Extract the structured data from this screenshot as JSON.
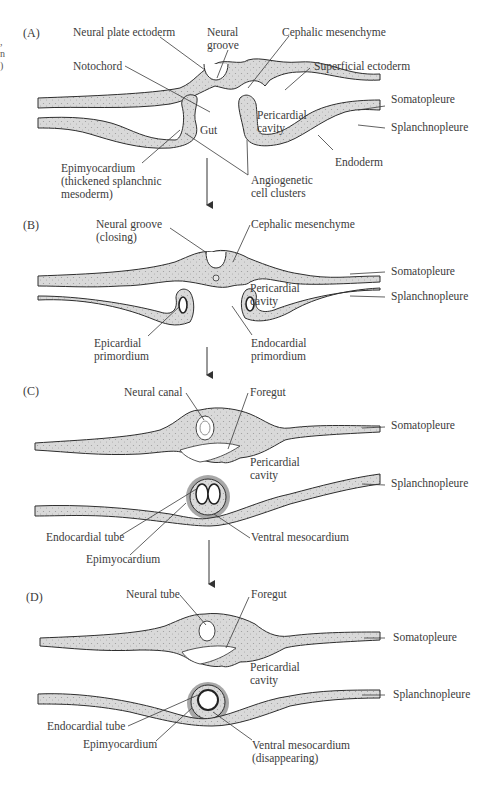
{
  "figure": {
    "margin_fragments": [
      ",",
      "n",
      ")"
    ],
    "panels": [
      {
        "id": "A",
        "letter": "(A)",
        "labels": {
          "neural_plate_ectoderm": "Neural plate ectoderm",
          "neural_groove_1": "Neural",
          "neural_groove_2": "groove",
          "cephalic_mesenchyme": "Cephalic mesenchyme",
          "notochord": "Notochord",
          "superficial_ectoderm": "Superficial ectoderm",
          "somatopleure": "Somatopleure",
          "gut": "Gut",
          "pericardial_cavity_1": "Pericardial",
          "pericardial_cavity_2": "cavity",
          "splanchnopleure": "Splanchnopleure",
          "endoderm": "Endoderm",
          "epimyocardium_1": "Epimyocardium",
          "epimyocardium_2": "(thickened splanchnic",
          "epimyocardium_3": "mesoderm)",
          "angiogenetic_1": "Angiogenetic",
          "angiogenetic_2": "cell clusters"
        }
      },
      {
        "id": "B",
        "letter": "(B)",
        "labels": {
          "neural_groove_1": "Neural groove",
          "neural_groove_2": "(closing)",
          "cephalic_mesenchyme": "Cephalic mesenchyme",
          "pericardial_cavity_1": "Pericardial",
          "pericardial_cavity_2": "cavity",
          "somatopleure": "Somatopleure",
          "splanchnopleure": "Splanchnopleure",
          "epicardial_1": "Epicardial",
          "epicardial_2": "primordium",
          "endocardial_1": "Endocardial",
          "endocardial_2": "primordium"
        }
      },
      {
        "id": "C",
        "letter": "(C)",
        "labels": {
          "neural_canal": "Neural canal",
          "foregut": "Foregut",
          "somatopleure": "Somatopleure",
          "pericardial_cavity_1": "Pericardial",
          "pericardial_cavity_2": "cavity",
          "splanchnopleure": "Splanchnopleure",
          "endocardial_tube": "Endocardial tube",
          "epimyocardium": "Epimyocardium",
          "ventral_mesocardium": "Ventral mesocardium"
        }
      },
      {
        "id": "D",
        "letter": "(D)",
        "labels": {
          "neural_tube": "Neural tube",
          "foregut": "Foregut",
          "somatopleure": "Somatopleure",
          "pericardial_cavity_1": "Pericardial",
          "pericardial_cavity_2": "cavity",
          "splanchnopleure": "Splanchnopleure",
          "endocardial_tube": "Endocardial tube",
          "epimyocardium": "Epimyocardium",
          "ventral_mesocardium_1": "Ventral mesocardium",
          "ventral_mesocardium_2": "(disappearing)"
        }
      }
    ],
    "colors": {
      "tissue_fill": "#d6d6d6",
      "outline": "#2e2e2e",
      "text": "#3b3b3b",
      "epimyocardium_shade": "#9a9a9a"
    }
  }
}
